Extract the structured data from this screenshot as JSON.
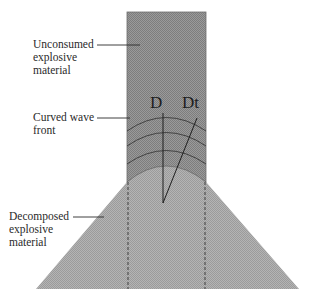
{
  "diagram": {
    "labels": {
      "unconsumed": "Unconsumed\nexplosive\nmaterial",
      "curved_front": "Curved wave\nfront",
      "decomposed": "Decomposed\nexplosive\nmaterial"
    },
    "symbols": {
      "detonation_velocity": "D",
      "tangential_velocity": "Dt"
    },
    "colors": {
      "unconsumed_fill": "#8f8f8f",
      "decomposed_fill": "#a9a9a9",
      "line": "#1e1e1e",
      "text": "#2a2a2a"
    }
  }
}
